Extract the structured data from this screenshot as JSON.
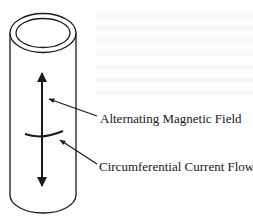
{
  "figure": {
    "colors": {
      "stroke": "#1a1a1a",
      "background": "#ffffff"
    }
  },
  "labels": {
    "magnetic_field": "Alternating Magnetic Field",
    "current_flow": "Circumferential Current Flow"
  }
}
